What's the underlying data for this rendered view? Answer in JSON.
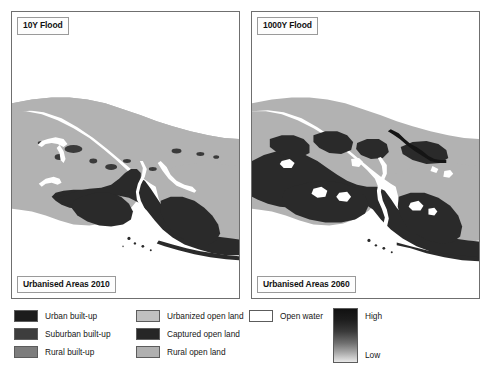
{
  "figure": {
    "panels": [
      {
        "id": "panel-left",
        "top_tag": "10Y Flood",
        "bottom_tag": "Urbanised Areas 2010",
        "scenario_year": "2010",
        "flood_return_period": "10Y"
      },
      {
        "id": "panel-right",
        "top_tag": "1000Y Flood",
        "bottom_tag": "Urbanised Areas 2060",
        "scenario_year": "2060",
        "flood_return_period": "1000Y"
      }
    ]
  },
  "legend": {
    "columns": [
      {
        "name": "built-up-classes",
        "items": [
          {
            "label": "Urban built-up",
            "color": "#1c1c1c"
          },
          {
            "label": "Suburban built-up",
            "color": "#3d3d3d"
          },
          {
            "label": "Rural built-up",
            "color": "#7d7d7d"
          }
        ]
      },
      {
        "name": "open-land-classes",
        "items": [
          {
            "label": "Urbanized open land",
            "color": "#c0c0c0"
          },
          {
            "label": "Captured open land",
            "color": "#262626"
          },
          {
            "label": "Rural open land",
            "color": "#b0b0b0"
          }
        ]
      },
      {
        "name": "water-class",
        "items": [
          {
            "label": "Open water",
            "color": "#ffffff"
          }
        ]
      }
    ],
    "ramp": {
      "name": "flood-depth-ramp",
      "high_label": "High",
      "low_label": "Low",
      "high_color": "#111111",
      "low_color": "#e8e8e8"
    }
  },
  "colors": {
    "land_rural": "#b2b2b2",
    "urban_dark": "#2a2a2a",
    "water_white": "#ffffff",
    "frame": "#6f6f6f",
    "text": "#161616"
  }
}
